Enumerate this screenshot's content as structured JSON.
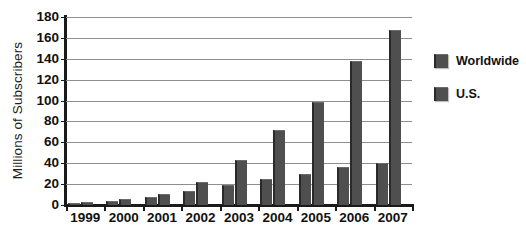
{
  "chart_data": {
    "type": "bar",
    "title": "",
    "xlabel": "",
    "ylabel": "Millions of Subscribers",
    "ylim": [
      0,
      180
    ],
    "yticks": [
      0,
      20,
      40,
      60,
      80,
      100,
      120,
      140,
      160,
      180
    ],
    "grid": true,
    "legend_position": "right",
    "categories": [
      "1999",
      "2000",
      "2001",
      "2002",
      "2003",
      "2004",
      "2005",
      "2006",
      "2007"
    ],
    "series": [
      {
        "name": "Worldwide",
        "color": "#4f4f4f",
        "values": [
          3,
          6,
          11,
          22,
          43,
          72,
          99,
          138,
          168
        ]
      },
      {
        "name": "U.S.",
        "color": "#4f4f4f",
        "values": [
          2,
          4,
          8,
          13,
          19,
          25,
          30,
          36,
          40
        ]
      }
    ]
  },
  "legend": {
    "items": [
      {
        "label": "Worldwide"
      },
      {
        "label": "U.S."
      }
    ]
  },
  "caption": {
    "text": ""
  }
}
